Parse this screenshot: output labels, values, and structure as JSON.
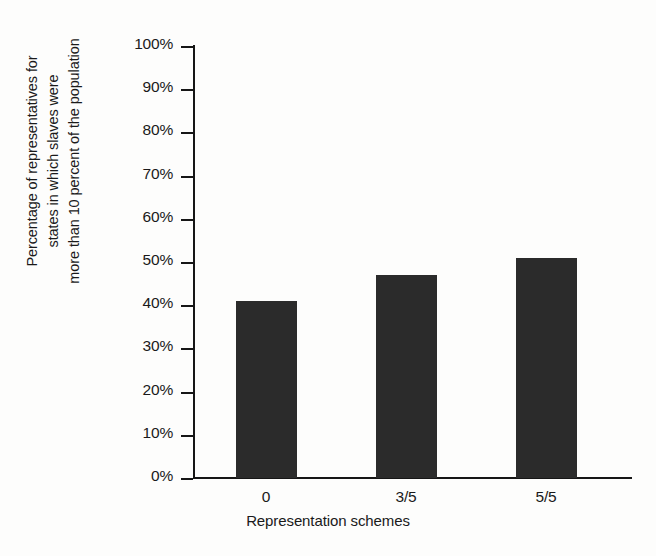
{
  "chart_data": {
    "type": "bar",
    "title": "",
    "categories": [
      "0",
      "3/5",
      "5/5"
    ],
    "values": [
      41,
      47,
      51
    ],
    "value_labels": [
      "41%",
      "47%",
      "51%"
    ],
    "xlabel": "Representation schemes",
    "ylabel": "Percentage of representatives for states in which slaves were more than 10 percent of the population",
    "ylabel_lines": [
      "Percentage of representatives for",
      "states in which slaves were",
      "more than 10 percent of the population"
    ],
    "ylim": [
      0,
      100
    ],
    "y_tick_labels": [
      "100%",
      "90%",
      "80%",
      "70%",
      "60%",
      "50%",
      "40%",
      "30%",
      "20%",
      "10%",
      "0%"
    ],
    "y_tick_values": [
      100,
      90,
      80,
      70,
      60,
      50,
      40,
      30,
      20,
      10,
      0
    ],
    "y_unit": "%",
    "grid": false,
    "legend": false,
    "legend_position": "none",
    "series": [
      {
        "name": "Percentage of representatives",
        "values": [
          41,
          47,
          51
        ]
      }
    ],
    "colors": {
      "bar": "#2b2b2b",
      "axis": "#161616",
      "background": "#fdfdfc",
      "text": "#1a1a1a"
    }
  }
}
